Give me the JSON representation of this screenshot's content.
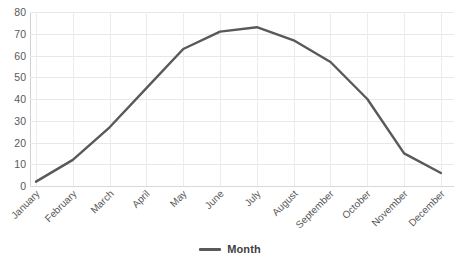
{
  "chart_data": {
    "type": "line",
    "title": "",
    "xlabel": "",
    "ylabel": "",
    "categories": [
      "January",
      "February",
      "March",
      "April",
      "May",
      "June",
      "July",
      "August",
      "September",
      "October",
      "November",
      "December"
    ],
    "series": [
      {
        "name": "Month",
        "values": [
          2,
          12,
          27,
          45,
          63,
          71,
          73,
          67,
          57,
          40,
          15,
          6
        ]
      }
    ],
    "ylim": [
      0,
      80
    ],
    "yticks": [
      0,
      10,
      20,
      30,
      40,
      50,
      60,
      70,
      80
    ],
    "ytick_labels": [
      "0",
      "10",
      "20",
      "30",
      "40",
      "50",
      "60",
      "70",
      "80"
    ],
    "grid": true,
    "legend_position": "bottom",
    "line_color": "#595959"
  },
  "legend": {
    "entries": [
      {
        "label": "Month",
        "color": "#595959"
      }
    ]
  },
  "axes": {
    "y_tick_labels": [
      "80",
      "70",
      "60",
      "50",
      "40",
      "30",
      "20",
      "10",
      "0"
    ],
    "x_tick_labels": [
      "January",
      "February",
      "March",
      "April",
      "May",
      "June",
      "July",
      "August",
      "September",
      "October",
      "November",
      "December"
    ]
  },
  "title_strip": ""
}
